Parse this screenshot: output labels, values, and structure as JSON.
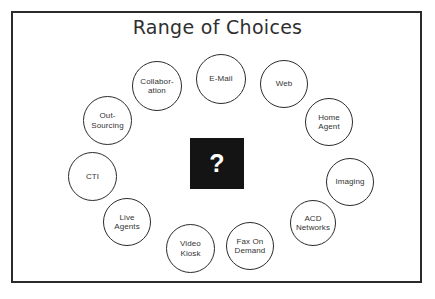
{
  "diagram": {
    "title": "Range of Choices",
    "center": {
      "symbol": "?",
      "background_color": "#141414",
      "text_color": "#ffffff"
    },
    "frame": {
      "border_color": "#2b2b2b"
    },
    "nodes": [
      {
        "id": "collaboration",
        "label": "Collabor-\nation",
        "x": 132,
        "y": 61,
        "size": 50
      },
      {
        "id": "email",
        "label": "E-Mail",
        "x": 196,
        "y": 54,
        "size": 50
      },
      {
        "id": "web",
        "label": "Web",
        "x": 260,
        "y": 60,
        "size": 48
      },
      {
        "id": "home-agent",
        "label": "Home\nAgent",
        "x": 305,
        "y": 98,
        "size": 48
      },
      {
        "id": "imaging",
        "label": "Imaging",
        "x": 326,
        "y": 158,
        "size": 48
      },
      {
        "id": "acd-networks",
        "label": "ACD\nNetworks",
        "x": 290,
        "y": 200,
        "size": 46
      },
      {
        "id": "fax-on-demand",
        "label": "Fax On\nDemand",
        "x": 226,
        "y": 222,
        "size": 48
      },
      {
        "id": "video-kiosk",
        "label": "Video\nKiosk",
        "x": 166,
        "y": 224,
        "size": 49
      },
      {
        "id": "live-agents",
        "label": "Live\nAgents",
        "x": 103,
        "y": 198,
        "size": 48
      },
      {
        "id": "cti",
        "label": "CTI",
        "x": 68,
        "y": 152,
        "size": 49
      },
      {
        "id": "out-sourcing",
        "label": "Out-\nSourcing",
        "x": 83,
        "y": 96,
        "size": 49
      }
    ]
  }
}
